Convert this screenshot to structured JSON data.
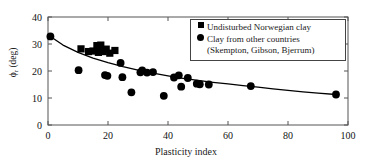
{
  "chart_data": {
    "type": "scatter",
    "title": "",
    "xlabel": "Plasticity index",
    "ylabel": "ϕr (deg)",
    "ylabel_symbol": "ϕ",
    "ylabel_sub": "r",
    "ylabel_unit": "(deg)",
    "xlim": [
      0,
      100
    ],
    "ylim": [
      0,
      40
    ],
    "xticks": [
      0,
      20,
      40,
      60,
      80,
      100
    ],
    "yticks": [
      0,
      10,
      20,
      30,
      40
    ],
    "xticklabels": [
      "0",
      "20",
      "40",
      "60",
      "80",
      "100"
    ],
    "yticklabels": [
      "0",
      "10",
      "20",
      "30",
      "40"
    ],
    "grid": false,
    "legend_position": "upper right",
    "series": [
      {
        "name": "Undisturbed Norwegian clay",
        "marker": "square",
        "color": "#000000",
        "points": [
          [
            11.0,
            28.2
          ],
          [
            13.5,
            27.2
          ],
          [
            15.0,
            27.4
          ],
          [
            16.3,
            29.4
          ],
          [
            16.8,
            26.9
          ],
          [
            17.6,
            29.6
          ],
          [
            18.4,
            27.2
          ],
          [
            19.4,
            28.1
          ],
          [
            20.6,
            26.6
          ],
          [
            22.3,
            27.6
          ]
        ]
      },
      {
        "name": "Clay from other countries",
        "marker": "circle",
        "color": "#000000",
        "points": [
          [
            0.8,
            32.8
          ],
          [
            10.2,
            20.3
          ],
          [
            19.0,
            18.5
          ],
          [
            19.8,
            18.2
          ],
          [
            24.2,
            23.0
          ],
          [
            24.8,
            17.7
          ],
          [
            27.8,
            12.1
          ],
          [
            30.8,
            19.5
          ],
          [
            31.4,
            20.2
          ],
          [
            33.0,
            19.4
          ],
          [
            35.0,
            19.6
          ],
          [
            38.6,
            10.8
          ],
          [
            42.0,
            17.6
          ],
          [
            43.6,
            18.4
          ],
          [
            44.4,
            14.2
          ],
          [
            46.6,
            17.4
          ],
          [
            49.6,
            15.3
          ],
          [
            50.6,
            15.1
          ],
          [
            53.6,
            15.0
          ],
          [
            67.6,
            14.4
          ],
          [
            96.0,
            11.3
          ]
        ]
      }
    ],
    "fit_curve": {
      "name": "trend",
      "color": "#000000",
      "points": [
        [
          0.8,
          32.8
        ],
        [
          5,
          29.6
        ],
        [
          10,
          26.9
        ],
        [
          15,
          24.8
        ],
        [
          20,
          23.1
        ],
        [
          25,
          21.6
        ],
        [
          30,
          20.3
        ],
        [
          35,
          19.2
        ],
        [
          40,
          18.2
        ],
        [
          45,
          17.3
        ],
        [
          50,
          16.5
        ],
        [
          55,
          15.8
        ],
        [
          60,
          15.2
        ],
        [
          65,
          14.6
        ],
        [
          70,
          14.0
        ],
        [
          75,
          13.4
        ],
        [
          80,
          12.8
        ],
        [
          85,
          12.3
        ],
        [
          90,
          11.8
        ],
        [
          96,
          11.3
        ]
      ]
    },
    "annotations": [
      "(Skempton, Gibson, Bjerrum)"
    ]
  },
  "legend": {
    "items": [
      {
        "label": "Undisturbed Norwegian clay",
        "marker": "square-marker-icon"
      },
      {
        "label": "Clay from other countries",
        "marker": "circle-marker-icon"
      }
    ],
    "continuation": "(Skempton, Gibson, Bjerrum)"
  }
}
